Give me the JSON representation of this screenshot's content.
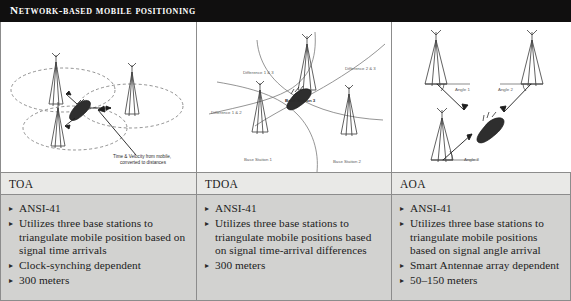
{
  "header": {
    "title": "Network-based mobile positioning"
  },
  "columns": [
    {
      "key": "toa",
      "header": "TOA",
      "bullet": "▸",
      "items": [
        "ANSI-41",
        "Utilizes three base stations to triangulate mobile position based on signal time arrivals",
        "Clock-synching dependent",
        "300 meters"
      ],
      "diagram": {
        "name": "toa-diagram",
        "caption_line1": "Time & Velocity  from mobile,",
        "caption_line2": "converted to distances"
      }
    },
    {
      "key": "tdoa",
      "header": "TDOA",
      "bullet": "▸",
      "items": [
        "ANSI-41",
        "Utilizes three base stations to triangulate mobile positions based on signal time-arrival differences",
        "300 meters"
      ],
      "diagram": {
        "name": "tdoa-diagram",
        "labels": {
          "diff_1_3": "Difference 1 & 3",
          "diff_2_3": "Difference 2 & 3",
          "diff_1_2": "Difference 1 & 2",
          "base_station_3": "Base Station 3",
          "base_station_1": "Base Station 1",
          "base_station_2": "Base Station 2"
        }
      }
    },
    {
      "key": "aoa",
      "header": "AOA",
      "bullet": "▸",
      "items": [
        "ANSI-41",
        "Utilizes three base stations to triangulate mobile positions based on signal angle arrival",
        "Smart Antennae array dependent",
        "50–150 meters"
      ],
      "diagram": {
        "name": "aoa-diagram",
        "labels": {
          "angle_1": "Angle 1",
          "angle_2": "Angle 2",
          "angle_3": "Angle 3"
        }
      }
    }
  ],
  "colors": {
    "title_bar": "#100f0f",
    "header_row": "#e9e9e7",
    "body_row": "#d2d2d0",
    "border": "#8c8c8c",
    "text": "#1d1d1d"
  }
}
